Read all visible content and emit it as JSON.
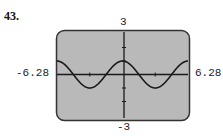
{
  "problem_number": "43.",
  "chart_data": {
    "type": "line",
    "title": "",
    "function": "y = cos(x)",
    "xlabel": "",
    "ylabel": "",
    "xlim": [
      -6.28,
      6.28
    ],
    "ylim": [
      -3,
      3
    ],
    "window_labels": {
      "xmin": "-6.28",
      "xmax": "6.28",
      "ymin": "-3",
      "ymax": "3"
    },
    "x_ticks": [
      -3.14,
      3.14
    ],
    "y_ticks": [
      -2,
      -1,
      1,
      2
    ],
    "grid": false,
    "legend": null,
    "series": [
      {
        "name": "cos(x)",
        "x": [
          -6.28,
          -4.71,
          -3.14,
          -1.57,
          0,
          1.57,
          3.14,
          4.71,
          6.28
        ],
        "values": [
          1,
          0,
          -1,
          0,
          1,
          0,
          -1,
          0,
          1
        ]
      }
    ],
    "colors": {
      "screen_bg": "#b9b9b9",
      "screen_border": "#333333",
      "curve": "#1a1a1a",
      "axes": "#1a1a1a"
    }
  }
}
